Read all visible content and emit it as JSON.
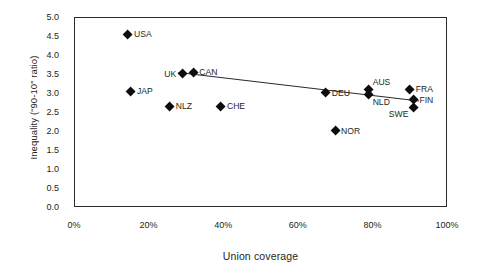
{
  "chart_data": {
    "type": "scatter",
    "title": "",
    "xlabel": "Union coverage",
    "ylabel": "Inequality (“90-10” ratio)",
    "xlim": [
      0,
      100
    ],
    "ylim": [
      0,
      5
    ],
    "xtick_labels": [
      "0%",
      "20%",
      "40%",
      "60%",
      "80%",
      "100%"
    ],
    "xtick_values": [
      0,
      20,
      40,
      60,
      80,
      100
    ],
    "ytick_labels": [
      "0.0",
      "0.5",
      "1.0",
      "1.5",
      "2.0",
      "2.5",
      "3.0",
      "3.5",
      "4.0",
      "4.5",
      "5.0"
    ],
    "ytick_values": [
      0,
      0.5,
      1.0,
      1.5,
      2.0,
      2.5,
      3.0,
      3.5,
      4.0,
      4.5,
      5.0
    ],
    "grid": false,
    "legend": "none",
    "marker": "diamond",
    "marker_color": "#0d0d0d",
    "frame_color": "#2b2b2b",
    "points": [
      {
        "label": "USA",
        "x": 14.5,
        "y": 4.55,
        "label_pos": "right"
      },
      {
        "label": "JAP",
        "x": 15.3,
        "y": 3.05,
        "label_pos": "right"
      },
      {
        "label": "NLZ",
        "x": 25.7,
        "y": 2.65,
        "label_pos": "right"
      },
      {
        "label": "UK",
        "x": 29.0,
        "y": 3.5,
        "label_pos": "left"
      },
      {
        "label": "CAN",
        "x": 32.0,
        "y": 3.55,
        "label_pos": "right"
      },
      {
        "label": "CHE",
        "x": 39.4,
        "y": 2.65,
        "label_pos": "right"
      },
      {
        "label": "DEU",
        "x": 67.5,
        "y": 3.0,
        "label_pos": "right"
      },
      {
        "label": "NOR",
        "x": 70.0,
        "y": 2.0,
        "label_pos": "right"
      },
      {
        "label": "AUS",
        "x": 79.0,
        "y": 3.1,
        "label_pos": "up"
      },
      {
        "label": "NLD",
        "x": 79.0,
        "y": 2.95,
        "label_pos": "down"
      },
      {
        "label": "FRA",
        "x": 90.0,
        "y": 3.1,
        "label_pos": "right"
      },
      {
        "label": "FIN",
        "x": 91.0,
        "y": 2.82,
        "label_pos": "right"
      },
      {
        "label": "SWE",
        "x": 91.0,
        "y": 2.62,
        "label_pos": "dleft"
      }
    ],
    "trend_line": {
      "x0": 28.0,
      "y0": 3.54,
      "x1": 92.5,
      "y1": 2.79,
      "color": "#2b2b2b"
    }
  }
}
